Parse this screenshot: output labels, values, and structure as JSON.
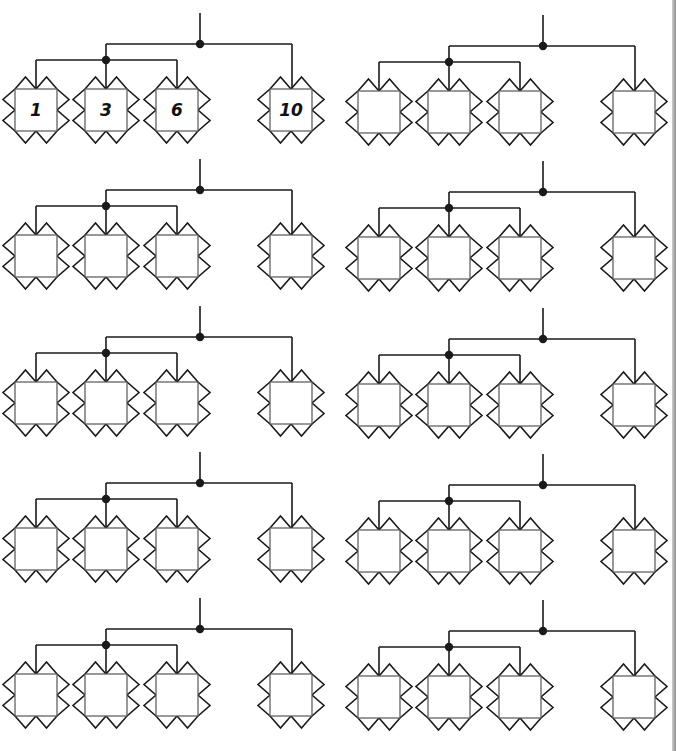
{
  "worksheet": {
    "colors": {
      "line": "#1a1a1a",
      "box": "#555555",
      "background": "#ffffff",
      "edge": "#9a9a9a"
    },
    "layout": {
      "row_tops": [
        13,
        159,
        306,
        452,
        598
      ],
      "column_offsets": [
        0,
        343
      ],
      "trunk_x": 200,
      "upper_bar_dy": 31,
      "lower_bar_dy": 47,
      "box_top_dy": 76,
      "box_size": 42,
      "point_depth": 12,
      "upper_bar_left_x": 106,
      "upper_bar_right_x": 292,
      "lower_bar_left_x": 36,
      "lower_bar_right_x": 177,
      "box_lefts": [
        15,
        85,
        156,
        270
      ]
    },
    "trees": [
      {
        "id": "tree-1",
        "row": 0,
        "col": 0,
        "values": [
          "1",
          "3",
          "6",
          "10"
        ]
      },
      {
        "id": "tree-2",
        "row": 0,
        "col": 1,
        "values": [
          "",
          "",
          "",
          ""
        ]
      },
      {
        "id": "tree-3",
        "row": 1,
        "col": 0,
        "values": [
          "",
          "",
          "",
          ""
        ]
      },
      {
        "id": "tree-4",
        "row": 1,
        "col": 1,
        "values": [
          "",
          "",
          "",
          ""
        ]
      },
      {
        "id": "tree-5",
        "row": 2,
        "col": 0,
        "values": [
          "",
          "",
          "",
          ""
        ]
      },
      {
        "id": "tree-6",
        "row": 2,
        "col": 1,
        "values": [
          "",
          "",
          "",
          ""
        ]
      },
      {
        "id": "tree-7",
        "row": 3,
        "col": 0,
        "values": [
          "",
          "",
          "",
          ""
        ]
      },
      {
        "id": "tree-8",
        "row": 3,
        "col": 1,
        "values": [
          "",
          "",
          "",
          ""
        ]
      },
      {
        "id": "tree-9",
        "row": 4,
        "col": 0,
        "values": [
          "",
          "",
          "",
          ""
        ]
      },
      {
        "id": "tree-10",
        "row": 4,
        "col": 1,
        "values": [
          "",
          "",
          "",
          ""
        ]
      }
    ]
  }
}
